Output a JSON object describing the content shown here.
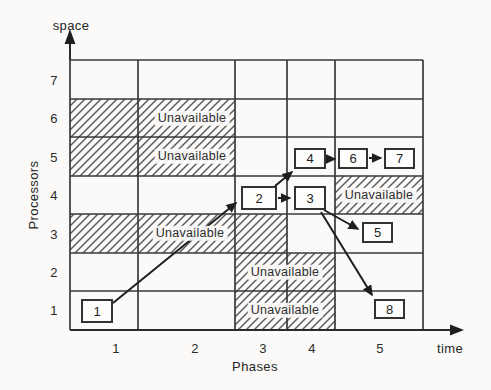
{
  "axes": {
    "y": {
      "arrow_label": "space",
      "axis_label": "Processors",
      "ticks": [
        "7",
        "6",
        "5",
        "4",
        "3",
        "2",
        "1"
      ]
    },
    "x": {
      "arrow_label": "time",
      "axis_label": "Phases",
      "ticks": [
        "1",
        "2",
        "3",
        "4",
        "5"
      ]
    }
  },
  "regions": {
    "items": [
      {
        "label": "Unavailable",
        "processor": 6,
        "phases": "1-2"
      },
      {
        "label": "Unavailable",
        "processor": 5,
        "phases": "1-2"
      },
      {
        "label": "Unavailable",
        "processor": 3,
        "phases": "1-3"
      },
      {
        "label": "Unavailable",
        "processor": 4,
        "phases": "5"
      },
      {
        "label": "Unavailable",
        "processor": 2,
        "phases": "3-4"
      },
      {
        "label": "Unavailable",
        "processor": 1,
        "phases": "3-4"
      }
    ]
  },
  "tasks": [
    {
      "id": "1",
      "processor": 1,
      "phase": 1
    },
    {
      "id": "2",
      "processor": 4,
      "phase": 3
    },
    {
      "id": "3",
      "processor": 4,
      "phase": 4
    },
    {
      "id": "4",
      "processor": 5,
      "phase": 4
    },
    {
      "id": "5",
      "processor": 3,
      "phase": 5
    },
    {
      "id": "6",
      "processor": 5,
      "phase": 5
    },
    {
      "id": "7",
      "processor": 5,
      "phase": 5
    },
    {
      "id": "8",
      "processor": 1,
      "phase": 5
    }
  ],
  "edges": [
    {
      "from": "1",
      "to": "2"
    },
    {
      "from": "2",
      "to": "3"
    },
    {
      "from": "2",
      "to": "4"
    },
    {
      "from": "4",
      "to": "6"
    },
    {
      "from": "6",
      "to": "7"
    },
    {
      "from": "3",
      "to": "5"
    },
    {
      "from": "3",
      "to": "8"
    }
  ],
  "colors": {
    "line": "#3a3a3a",
    "hatch": "#5c5c5c",
    "arrow": "#1e1e1e",
    "background": "#fbfaf8",
    "box_fill": "#fdfdfc",
    "text": "#222222"
  }
}
